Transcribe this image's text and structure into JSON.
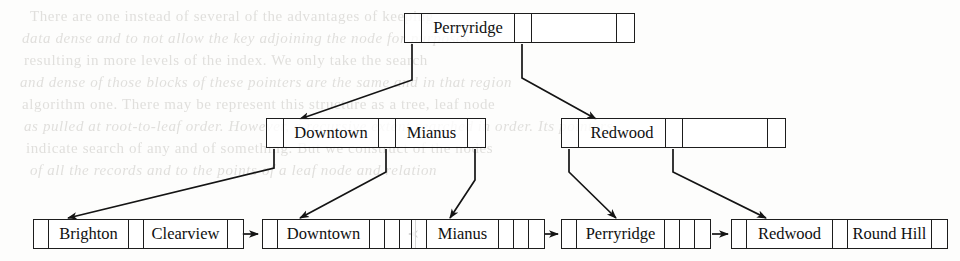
{
  "document": {
    "kind": "b-plus-tree-diagram",
    "description": "B+-tree index structure over branch-name with root Perryridge"
  },
  "background_text": {
    "lines": [
      {
        "text": "There are one instead of several of the advantages of keeping",
        "x": 30,
        "y": 8
      },
      {
        "text": "data dense and to not allow the key adjoining the node for purposes",
        "x": 22,
        "y": 30
      },
      {
        "text": "resulting in more levels of the index. We only take the search",
        "x": 24,
        "y": 52
      },
      {
        "text": "and dense of those blocks of these pointers are the same and in that region",
        "x": 20,
        "y": 74
      },
      {
        "text": "algorithm one. There may be represent this structure as a tree, leaf node",
        "x": 22,
        "y": 96
      },
      {
        "text": "as pulled at root-to-leaf order. However, a recursive extent searched in order. Its pointers",
        "x": 24,
        "y": 118
      },
      {
        "text": "indicate search of any and of something. But we construct of the nodes",
        "x": 26,
        "y": 140
      },
      {
        "text": "of all the records and to the points of a leaf node and relation",
        "x": 30,
        "y": 162
      }
    ]
  },
  "tree": {
    "root": {
      "name": "root-node",
      "cells": [
        {
          "type": "pointer",
          "label": "",
          "w": 17
        },
        {
          "type": "key",
          "label": "Perryridge",
          "w": 93
        },
        {
          "type": "pointer",
          "label": "",
          "w": 17
        },
        {
          "type": "empty",
          "label": "",
          "w": 85
        },
        {
          "type": "empty",
          "label": "",
          "w": 17
        }
      ]
    },
    "internal": [
      {
        "name": "internal-node-left",
        "cells": [
          {
            "type": "pointer",
            "label": "",
            "w": 17
          },
          {
            "type": "key",
            "label": "Downtown",
            "w": 95
          },
          {
            "type": "pointer",
            "label": "",
            "w": 17
          },
          {
            "type": "key",
            "label": "Mianus",
            "w": 72
          },
          {
            "type": "pointer",
            "label": "",
            "w": 17
          }
        ]
      },
      {
        "name": "internal-node-right",
        "cells": [
          {
            "type": "pointer",
            "label": "",
            "w": 17
          },
          {
            "type": "key",
            "label": "Redwood",
            "w": 87
          },
          {
            "type": "pointer",
            "label": "",
            "w": 17
          },
          {
            "type": "empty",
            "label": "",
            "w": 85
          },
          {
            "type": "empty",
            "label": "",
            "w": 17
          }
        ]
      }
    ],
    "leaves": [
      {
        "name": "leaf-node-brighton-clearview",
        "cells": [
          {
            "type": "pointer",
            "label": "",
            "w": 15
          },
          {
            "type": "key",
            "label": "Brighton",
            "w": 80
          },
          {
            "type": "pointer",
            "label": "",
            "w": 15
          },
          {
            "type": "key",
            "label": "Clearview",
            "w": 84
          },
          {
            "type": "pointer",
            "label": "",
            "w": 15
          }
        ]
      },
      {
        "name": "leaf-node-downtown",
        "cells": [
          {
            "type": "pointer",
            "label": "",
            "w": 15
          },
          {
            "type": "key",
            "label": "Downtown",
            "w": 92
          },
          {
            "type": "empty",
            "label": "",
            "w": 15
          },
          {
            "type": "empty",
            "label": "",
            "w": 15
          },
          {
            "type": "empty",
            "label": "",
            "w": 15
          }
        ]
      },
      {
        "name": "leaf-node-mianus",
        "cells": [
          {
            "type": "pointer",
            "label": "",
            "w": 15
          },
          {
            "type": "key",
            "label": "Mianus",
            "w": 72
          },
          {
            "type": "empty",
            "label": "",
            "w": 15
          },
          {
            "type": "empty",
            "label": "",
            "w": 15
          },
          {
            "type": "empty",
            "label": "",
            "w": 15
          }
        ]
      },
      {
        "name": "leaf-node-perryridge",
        "cells": [
          {
            "type": "pointer",
            "label": "",
            "w": 15
          },
          {
            "type": "key",
            "label": "Perryridge",
            "w": 88
          },
          {
            "type": "empty",
            "label": "",
            "w": 15
          },
          {
            "type": "empty",
            "label": "",
            "w": 15
          },
          {
            "type": "empty",
            "label": "",
            "w": 15
          }
        ]
      },
      {
        "name": "leaf-node-redwood-roundhill",
        "cells": [
          {
            "type": "pointer",
            "label": "",
            "w": 15
          },
          {
            "type": "key",
            "label": "Redwood",
            "w": 86
          },
          {
            "type": "pointer",
            "label": "",
            "w": 15
          },
          {
            "type": "key",
            "label": "Round Hill",
            "w": 84
          },
          {
            "type": "pointer",
            "label": "",
            "w": 15
          }
        ]
      }
    ]
  },
  "geometry": {
    "root": {
      "x": 404,
      "y": 13,
      "h": 30
    },
    "internal": [
      {
        "x": 266,
        "y": 118,
        "h": 30
      },
      {
        "x": 561,
        "y": 118,
        "h": 30
      }
    ],
    "leaves": [
      {
        "x": 33,
        "y": 219,
        "h": 30
      },
      {
        "x": 262,
        "y": 219,
        "h": 30
      },
      {
        "x": 411,
        "y": 219,
        "h": 30
      },
      {
        "x": 561,
        "y": 219,
        "h": 30
      },
      {
        "x": 731,
        "y": 219,
        "h": 30
      }
    ]
  },
  "colors": {
    "ink": "#141414",
    "paper": "#fdfdfc",
    "bleed": "#c9c7c3"
  }
}
